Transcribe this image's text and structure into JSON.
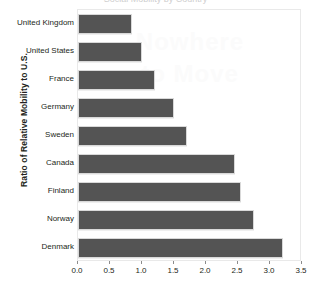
{
  "chart_data": {
    "type": "bar",
    "orientation": "horizontal",
    "title": "",
    "xlabel": "",
    "ylabel": "Ratio of Relative Mobility to U.S.",
    "categories": [
      "United Kingdom",
      "United States",
      "France",
      "Germany",
      "Sweden",
      "Canada",
      "Finland",
      "Norway",
      "Denmark"
    ],
    "values": [
      0.85,
      1.0,
      1.2,
      1.5,
      1.7,
      2.45,
      2.55,
      2.75,
      3.2
    ],
    "xlim": [
      0.0,
      3.5
    ],
    "xticks": [
      0.0,
      0.5,
      1.0,
      1.5,
      2.0,
      2.5,
      3.0,
      3.5
    ],
    "xtick_labels": [
      "0.0",
      "0.5",
      "1.0",
      "1.5",
      "2.0",
      "2.5",
      "3.0",
      "3.5"
    ],
    "grid": false,
    "legend": false,
    "bar_color": "#545454",
    "bar_edge_color": "#d9d9d9",
    "frame_color": "#e9e9e9",
    "text_color": "#231f20"
  },
  "watermark": {
    "line1": "Nowhere",
    "line2": "to Move"
  },
  "title_sliver": {
    "text": "Social Mobility by Country"
  }
}
